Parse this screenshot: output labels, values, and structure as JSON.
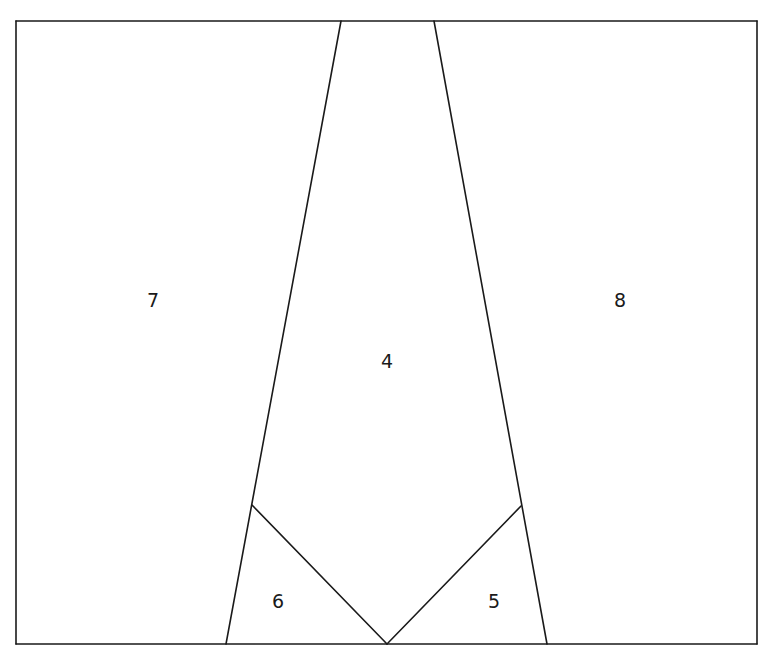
{
  "diagram": {
    "type": "planar-partition",
    "frame": {
      "x1": 16,
      "y1": 21,
      "x2": 757,
      "y2": 644
    },
    "stroke_color": "#1a1a1a",
    "background": "#ffffff",
    "edges": [
      {
        "id": "top",
        "from": [
          16,
          21
        ],
        "to": [
          757,
          21
        ]
      },
      {
        "id": "bottom",
        "from": [
          16,
          644
        ],
        "to": [
          757,
          644
        ]
      },
      {
        "id": "left",
        "from": [
          16,
          21
        ],
        "to": [
          16,
          644
        ]
      },
      {
        "id": "right",
        "from": [
          757,
          21
        ],
        "to": [
          757,
          644
        ]
      },
      {
        "id": "left-diagonal",
        "from": [
          341,
          21
        ],
        "to": [
          226,
          644
        ]
      },
      {
        "id": "right-diagonal",
        "from": [
          434,
          21
        ],
        "to": [
          547,
          644
        ]
      },
      {
        "id": "v-left",
        "from": [
          252,
          505
        ],
        "to": [
          387,
          644
        ]
      },
      {
        "id": "v-right",
        "from": [
          521,
          506
        ],
        "to": [
          387,
          644
        ]
      }
    ],
    "regions": [
      {
        "label": "7",
        "x": 153,
        "y": 300
      },
      {
        "label": "8",
        "x": 620,
        "y": 300
      },
      {
        "label": "4",
        "x": 387,
        "y": 361
      },
      {
        "label": "6",
        "x": 278,
        "y": 601
      },
      {
        "label": "5",
        "x": 494,
        "y": 601
      }
    ]
  }
}
